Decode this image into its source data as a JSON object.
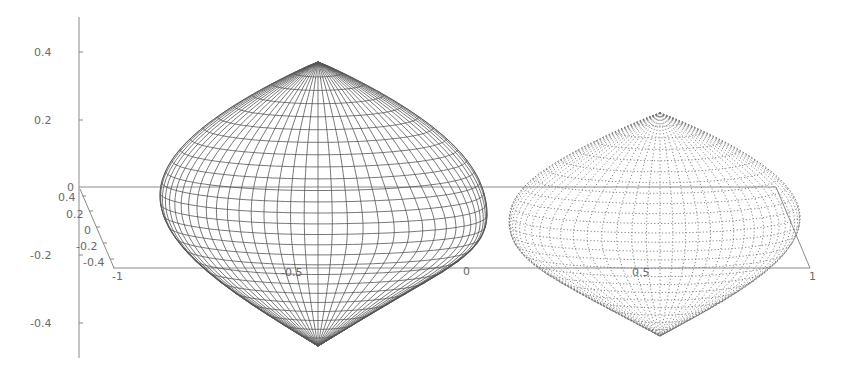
{
  "chart_data": {
    "type": "surface3d",
    "title": "",
    "z_axis": {
      "ticks": [
        0.4,
        0.2,
        0,
        -0.2,
        -0.4
      ],
      "tick_labels": [
        "0.4",
        "0.2",
        "0",
        "-0.2",
        "-0.4"
      ],
      "range": [
        -0.5,
        0.5
      ]
    },
    "y_axis": {
      "ticks": [
        0.4,
        0.2,
        0,
        -0.2,
        -0.4
      ],
      "tick_labels": [
        "0.4",
        "0.2",
        "0",
        "-0.2",
        "-0.4"
      ]
    },
    "x_axis": {
      "ticks": [
        -1,
        -0.5,
        0,
        0.5,
        1
      ],
      "tick_labels": [
        "-1",
        "-0.5",
        "0",
        "0.5",
        "1"
      ],
      "range": [
        -1,
        1
      ]
    },
    "series": [
      {
        "name": "left-lobe",
        "style": "solid",
        "x_range": [
          -1,
          0
        ],
        "center_x": -0.5,
        "z_extent": [
          -0.46,
          0.29
        ]
      },
      {
        "name": "right-lobe",
        "style": "dotted",
        "x_range": [
          0,
          1
        ],
        "center_x": 0.5,
        "z_extent": [
          -0.43,
          0.2
        ]
      }
    ],
    "grid": false,
    "legend": null
  },
  "labels": {
    "z": [
      "0.4",
      "0.2",
      "0",
      "-0.2",
      "-0.4"
    ],
    "y": [
      "0.4",
      "0.2",
      "0",
      "-0.2",
      "-0.4"
    ],
    "x": [
      "-1",
      "-0.5",
      "0",
      "0.5",
      "1"
    ]
  }
}
